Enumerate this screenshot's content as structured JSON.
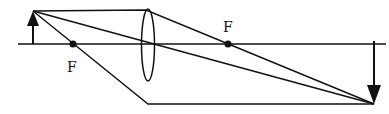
{
  "diagram": {
    "type": "ray-diagram-converging-lens",
    "labels": {
      "focal_left": "F",
      "focal_right": "F"
    },
    "colors": {
      "line": "#111111",
      "background": "#ffffff"
    }
  }
}
